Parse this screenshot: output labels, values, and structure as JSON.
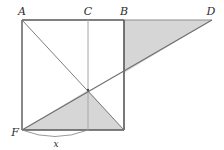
{
  "figure": {
    "background_color": "#ffffff",
    "stroke_color_heavy": "#4a4a4a",
    "stroke_color_light": "#8c8c8c",
    "stroke_color_thin": "#7a7a7a",
    "shade_fill": "#d6d6d6",
    "shade_stroke": "#6e6e6e",
    "labels": {
      "A": "A",
      "B": "B",
      "C": "C",
      "D": "D",
      "F": "F",
      "x": "x"
    },
    "points": {
      "A": {
        "x": 22,
        "y": 20
      },
      "C": {
        "x": 88,
        "y": 20
      },
      "B": {
        "x": 124,
        "y": 20
      },
      "D": {
        "x": 212,
        "y": 20
      },
      "F": {
        "x": 22,
        "y": 130
      },
      "E": {
        "x": 124,
        "y": 130
      },
      "G": {
        "x": 88,
        "y": 130
      },
      "P": {
        "x": 88,
        "y": 90
      },
      "Q": {
        "x": 124,
        "y": 73
      }
    },
    "label_positions": {
      "A": {
        "x": 22,
        "y": 14
      },
      "C": {
        "x": 88,
        "y": 14
      },
      "B": {
        "x": 124,
        "y": 14
      },
      "D": {
        "x": 210,
        "y": 14
      },
      "F": {
        "x": 16,
        "y": 134
      },
      "x": {
        "x": 56,
        "y": 146
      }
    },
    "segments": {
      "square_top": "A to B",
      "square_left": "A to F",
      "square_bottom": "F to E",
      "square_right": "B to E",
      "median_CG": "C to G",
      "diagonal_AE": "A to E",
      "ray_FD": "F to D",
      "top_BD": "B to D",
      "arc_Fx": "arc from F to G"
    },
    "shaded_regions": [
      {
        "name": "triangle-BDQ",
        "vertices": "B, D, Q"
      },
      {
        "name": "triangle-FEP",
        "vertices": "F, E, P"
      }
    ]
  }
}
